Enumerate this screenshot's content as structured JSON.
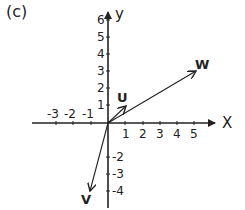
{
  "figure": {
    "panel_label": "(c)",
    "x_axis_label": "X",
    "y_axis_label": "y",
    "x_tick_labels": [
      "-3",
      "-2",
      "-1",
      "1",
      "2",
      "3",
      "4",
      "5"
    ],
    "y_tick_labels": [
      "6",
      "5",
      "4",
      "3",
      "2",
      "1",
      "-2",
      "-3",
      "-4"
    ],
    "vectors": [
      {
        "name": "U",
        "x": 1,
        "y": 1
      },
      {
        "name": "W",
        "x": 5,
        "y": 3
      },
      {
        "name": "V",
        "x": -1,
        "y": -4
      }
    ]
  }
}
